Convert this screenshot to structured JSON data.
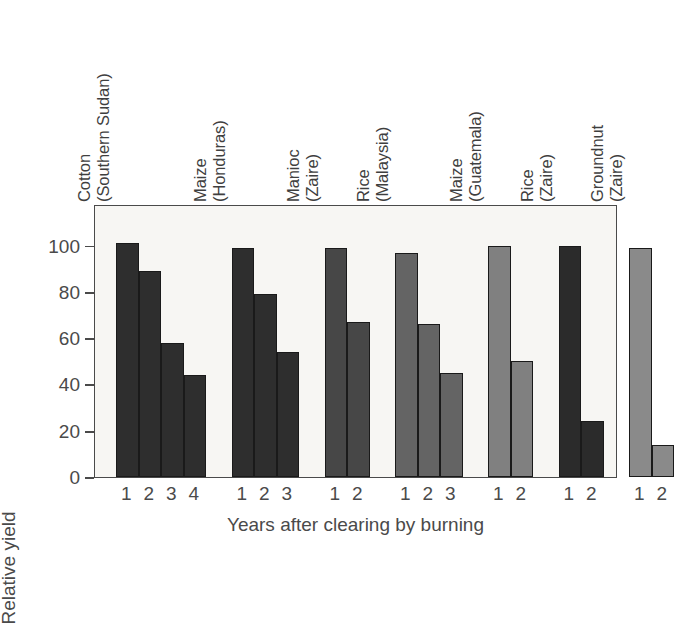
{
  "chart_data": {
    "type": "bar",
    "title": "",
    "xlabel": "Years after clearing by burning",
    "ylabel": "Relative yield",
    "ylim": [
      0,
      118
    ],
    "yticks": [
      0,
      20,
      40,
      60,
      80,
      100
    ],
    "ytick_labels": [
      "0",
      "20",
      "40",
      "60",
      "80",
      "100"
    ],
    "grid": false,
    "legend": "none",
    "groups": [
      {
        "crop": "Cotton",
        "place": "(Southern Sudan)",
        "color": "#2e2e2e",
        "categories": [
          "1",
          "2",
          "3",
          "4"
        ],
        "values": [
          101,
          89,
          58,
          44
        ]
      },
      {
        "crop": "Maize",
        "place": "(Honduras)",
        "color": "#2e2e2e",
        "categories": [
          "1",
          "2",
          "3"
        ],
        "values": [
          99,
          79,
          54
        ]
      },
      {
        "crop": "Manioc",
        "place": "(Zaire)",
        "color": "#474747",
        "categories": [
          "1",
          "2"
        ],
        "values": [
          99,
          67
        ]
      },
      {
        "crop": "Rice",
        "place": "(Malaysia)",
        "color": "#646464",
        "categories": [
          "1",
          "2",
          "3"
        ],
        "values": [
          97,
          66,
          45
        ]
      },
      {
        "crop": "Maize",
        "place": "(Guatemala)",
        "color": "#808080",
        "categories": [
          "1",
          "2"
        ],
        "values": [
          100,
          50
        ]
      },
      {
        "crop": "Rice",
        "place": "(Zaire)",
        "color": "#2b2b2b",
        "categories": [
          "1",
          "2"
        ],
        "values": [
          100,
          24
        ]
      },
      {
        "crop": "Groundnut",
        "place": "(Zaire)",
        "color": "#8a8a8a",
        "categories": [
          "1",
          "2"
        ],
        "values": [
          99,
          14
        ]
      }
    ]
  }
}
